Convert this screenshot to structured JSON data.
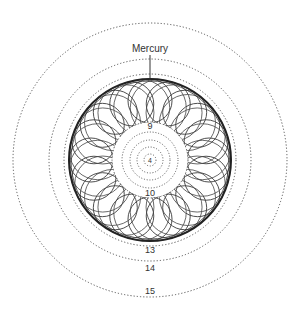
{
  "diagram": {
    "title_label": "Mercury",
    "center": {
      "x": 150,
      "y": 160
    },
    "labels": {
      "inner_top": "9",
      "center": "4",
      "inner_bottom": "10",
      "ring_13": "13",
      "ring_14": "14",
      "ring_15": "15"
    },
    "dotted_rings_radii": [
      137,
      101,
      86
    ],
    "inner_dotted_radii": [
      28,
      20,
      13,
      6
    ],
    "inner_clear_radius": 38,
    "spirograph": {
      "outer_radius": 81,
      "loops": 20,
      "loop_radius": 22
    },
    "colors": {
      "line": "#333333",
      "dots": "#555555",
      "background": "#ffffff"
    }
  }
}
